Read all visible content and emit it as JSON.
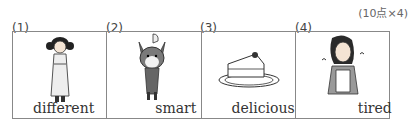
{
  "points_label": "(10点×4)",
  "items": [
    {
      "num": "(1)",
      "word": "different",
      "image": "girl-in-kimono-icon"
    },
    {
      "num": "(2)",
      "word": "smart",
      "image": "shiba-dog-icon"
    },
    {
      "num": "(3)",
      "word": "delicious",
      "image": "cake-slice-icon"
    },
    {
      "num": "(4)",
      "word": "tired",
      "image": "tired-woman-icon"
    }
  ]
}
